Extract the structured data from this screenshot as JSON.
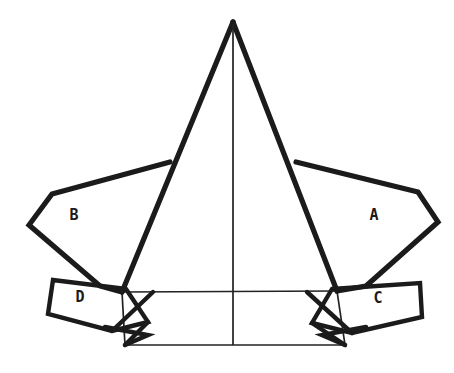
{
  "figure": {
    "background_color": "#ffffff",
    "line_color": "#1b1b1b",
    "thin_line_color": "#222222",
    "label_color": "#1a1a1a",
    "width": 454,
    "height": 373
  },
  "labels": {
    "a": "A",
    "b": "B",
    "c": "C",
    "d": "D"
  },
  "label_positions": {
    "a": {
      "x": 374,
      "y": 215
    },
    "b": {
      "x": 74,
      "y": 215
    },
    "c": {
      "x": 378,
      "y": 298
    },
    "d": {
      "x": 80,
      "y": 297
    }
  },
  "geometry": {
    "apex": {
      "x": 233,
      "y": 22
    },
    "center_axis_x": 233,
    "center_axis_top_y": 24,
    "center_axis_bottom_y": 345,
    "main_triangle": [
      {
        "x": 233,
        "y": 22
      },
      {
        "x": 337,
        "y": 291
      },
      {
        "x": 122,
        "y": 292
      }
    ],
    "flap_a": [
      {
        "x": 296,
        "y": 162
      },
      {
        "x": 418,
        "y": 192
      },
      {
        "x": 438,
        "y": 222
      },
      {
        "x": 366,
        "y": 286
      },
      {
        "x": 337,
        "y": 291
      }
    ],
    "flap_b": [
      {
        "x": 170,
        "y": 162
      },
      {
        "x": 52,
        "y": 194
      },
      {
        "x": 29,
        "y": 225
      },
      {
        "x": 100,
        "y": 286
      },
      {
        "x": 122,
        "y": 292
      }
    ],
    "flap_c": [
      {
        "x": 332,
        "y": 289
      },
      {
        "x": 420,
        "y": 283
      },
      {
        "x": 422,
        "y": 317
      },
      {
        "x": 352,
        "y": 333
      },
      {
        "x": 312,
        "y": 323
      }
    ],
    "flap_d": [
      {
        "x": 126,
        "y": 289
      },
      {
        "x": 53,
        "y": 280
      },
      {
        "x": 48,
        "y": 314
      },
      {
        "x": 112,
        "y": 331
      },
      {
        "x": 148,
        "y": 322
      }
    ],
    "base_rect": [
      {
        "x": 122,
        "y": 292
      },
      {
        "x": 337,
        "y": 291
      },
      {
        "x": 345,
        "y": 345
      },
      {
        "x": 125,
        "y": 345
      }
    ],
    "base_left_diagonal": [
      {
        "x": 148,
        "y": 292
      },
      {
        "x": 125,
        "y": 345
      }
    ],
    "base_right_diagonal": [
      {
        "x": 312,
        "y": 291
      },
      {
        "x": 345,
        "y": 345
      }
    ],
    "tab_left": [
      {
        "x": 105,
        "y": 327
      },
      {
        "x": 148,
        "y": 335
      },
      {
        "x": 125,
        "y": 345
      }
    ],
    "tab_right": [
      {
        "x": 366,
        "y": 327
      },
      {
        "x": 322,
        "y": 335
      },
      {
        "x": 345,
        "y": 345
      }
    ]
  }
}
